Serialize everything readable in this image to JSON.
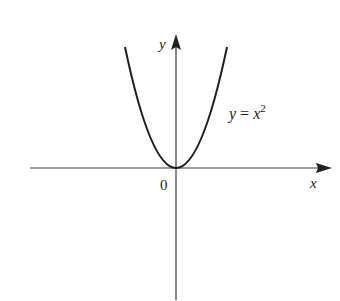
{
  "diagram": {
    "equation_label": {
      "lhs": "y",
      "eq": " = ",
      "base": "x",
      "exponent": "2"
    },
    "x_axis_label": "x",
    "y_axis_label": "y",
    "origin_label": "0",
    "colors": {
      "axis": "#3a3a3a",
      "curve": "#1e1e1e",
      "text": "#222222",
      "background": "#ffffff"
    }
  }
}
